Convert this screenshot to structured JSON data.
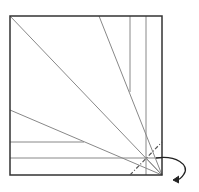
{
  "diagram": {
    "type": "origami-fold-step",
    "colors": {
      "outline": "#333333",
      "crease": "#888888",
      "valley": "#555555",
      "arrow": "#222222"
    },
    "square": {
      "x": 10,
      "y": 16,
      "size": 152
    },
    "creases": [
      {
        "name": "diagonal-main",
        "x1": 10,
        "y1": 16,
        "x2": 162,
        "y2": 175
      },
      {
        "name": "diagonal-left",
        "x1": 10,
        "y1": 110,
        "x2": 162,
        "y2": 175
      },
      {
        "name": "diagonal-top",
        "x1": 99,
        "y1": 16,
        "x2": 162,
        "y2": 175
      },
      {
        "name": "vertical-1",
        "x1": 130,
        "y1": 16,
        "x2": 130,
        "y2": 92
      },
      {
        "name": "vertical-2",
        "x1": 146,
        "y1": 16,
        "x2": 146,
        "y2": 175
      },
      {
        "name": "horizontal-1",
        "x1": 10,
        "y1": 142,
        "x2": 84,
        "y2": 142
      },
      {
        "name": "horizontal-2",
        "x1": 10,
        "y1": 158,
        "x2": 162,
        "y2": 158
      }
    ],
    "valley_fold": {
      "x1": 130,
      "y1": 175,
      "x2": 162,
      "y2": 142
    },
    "arrow": {
      "label": "fold-corner-behind"
    }
  }
}
